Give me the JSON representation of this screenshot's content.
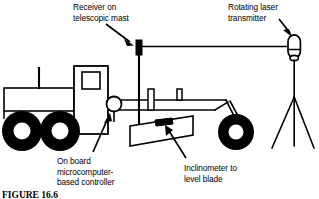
{
  "figure": {
    "caption": "FIGURE 16.6",
    "background_color": "#ffffff",
    "line_color": "#000000",
    "width": 319,
    "height": 199
  },
  "labels": {
    "receiver": {
      "name": "receiver-on-telescopic-mast",
      "line1": "Receiver on",
      "line2": "telescopic mast"
    },
    "transmitter": {
      "name": "rotating-laser-transmitter",
      "line1": "Rotating laser",
      "line2": "transmitter"
    },
    "controller": {
      "name": "on-board-microcomputer-based-controller",
      "line1": "On board",
      "line2": "microcomputer-",
      "line3": "based controller"
    },
    "inclinometer": {
      "name": "inclinometer-to-level-blade",
      "line1": "Inclinometer to",
      "line2": "level blade"
    }
  },
  "components": {
    "grader_body": "motor-grader-body",
    "cab": "operator-cab",
    "cab_window": "cab-window",
    "engine_hood": "engine-hood",
    "exhaust_stack": "exhaust-stack",
    "rear_wheel_1": "rear-wheel-left",
    "rear_wheel_2": "rear-wheel-right",
    "front_wheel": "front-wheel",
    "controller_circle": "controller-housing",
    "mast": "telescopic-mast",
    "receiver_head": "laser-receiver-head",
    "blade": "grader-blade",
    "inclinometer_sensor": "inclinometer-sensor",
    "laser_beam": "laser-beam",
    "transmitter_head": "laser-transmitter-head",
    "tripod": "tripod"
  }
}
